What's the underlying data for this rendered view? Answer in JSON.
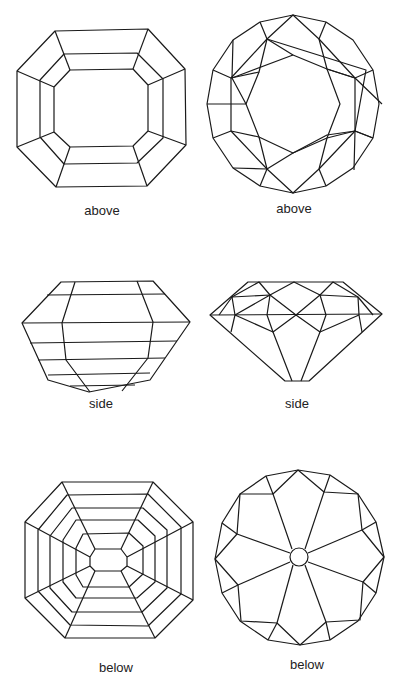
{
  "figures": [
    {
      "cut": "emerald",
      "view": "above",
      "label": "above"
    },
    {
      "cut": "round-brilliant",
      "view": "above",
      "label": "above"
    },
    {
      "cut": "emerald",
      "view": "side",
      "label": "side"
    },
    {
      "cut": "round-brilliant",
      "view": "side",
      "label": "side"
    },
    {
      "cut": "emerald",
      "view": "below",
      "label": "below"
    },
    {
      "cut": "round-brilliant",
      "view": "below",
      "label": "below"
    }
  ],
  "line_color": "#1a1a1a",
  "background": "#ffffff"
}
